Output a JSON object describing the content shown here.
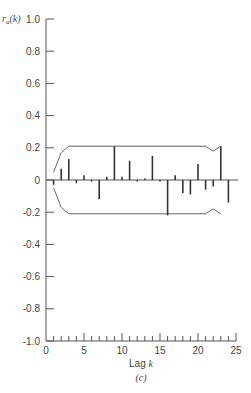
{
  "chart_data": {
    "type": "bar",
    "subtype": "autocorrelation-stem",
    "title": "",
    "panel_label": "(c)",
    "xlabel": "Lag k",
    "ylabel": "r_a(k)",
    "xlim": [
      0,
      25
    ],
    "ylim": [
      -1.0,
      1.0
    ],
    "x_ticks": [
      0,
      5,
      10,
      15,
      20,
      25
    ],
    "x_tick_labels": [
      "0",
      "5",
      "10",
      "15",
      "20",
      "25"
    ],
    "y_ticks": [
      1.0,
      0.8,
      0.6,
      0.4,
      0.2,
      0,
      -0.2,
      -0.4,
      -0.6,
      -0.8,
      -1.0
    ],
    "y_tick_labels": [
      "1.0",
      "0.8",
      "0.6",
      "0.4",
      "0.2",
      "0",
      "-0.2",
      "-0.4",
      "-0.6",
      "-0.8",
      "-1.0"
    ],
    "grid": false,
    "legend": null,
    "categories": [
      1,
      2,
      3,
      4,
      5,
      6,
      7,
      8,
      9,
      10,
      11,
      12,
      13,
      14,
      15,
      16,
      17,
      18,
      19,
      20,
      21,
      22,
      23,
      24
    ],
    "values": [
      -0.03,
      0.07,
      0.13,
      -0.02,
      0.03,
      -0.01,
      -0.12,
      0.02,
      0.21,
      0.02,
      0.12,
      -0.01,
      0.01,
      0.15,
      -0.01,
      -0.22,
      0.03,
      -0.08,
      -0.09,
      0.1,
      -0.06,
      -0.04,
      0.21,
      -0.14
    ],
    "confidence_band": {
      "description": "approximate 2-standard-error limits",
      "upper": [
        [
          1,
          0.05
        ],
        [
          2,
          0.17
        ],
        [
          3,
          0.21
        ],
        [
          21,
          0.21
        ],
        [
          22,
          0.18
        ],
        [
          23,
          0.21
        ]
      ],
      "lower": [
        [
          1,
          -0.05
        ],
        [
          2,
          -0.17
        ],
        [
          3,
          -0.21
        ],
        [
          21,
          -0.21
        ],
        [
          22,
          -0.18
        ],
        [
          23,
          -0.21
        ]
      ]
    }
  }
}
